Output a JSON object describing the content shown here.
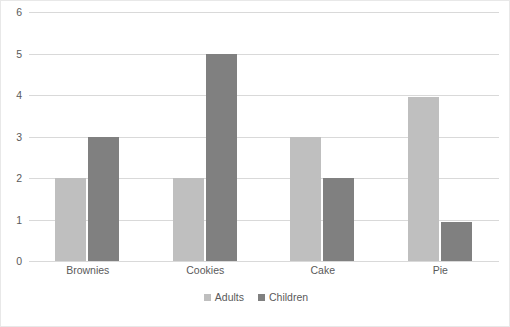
{
  "chart_data": {
    "type": "bar",
    "title": "",
    "subtitle": "",
    "xlabel": "",
    "ylabel": "",
    "categories": [
      "Brownies",
      "Cookies",
      "Cake",
      "Pie"
    ],
    "series": [
      {
        "name": "Adults",
        "color": "#bfbfbf",
        "values": [
          2,
          2,
          3,
          3.95
        ]
      },
      {
        "name": "Children",
        "color": "#808080",
        "values": [
          3,
          5,
          2,
          0.95
        ]
      }
    ],
    "ylim": [
      0,
      6
    ],
    "ytick_labels": [
      "0",
      "1",
      "2",
      "3",
      "4",
      "5",
      "6"
    ],
    "ytick_values": [
      0,
      1,
      2,
      3,
      4,
      5,
      6
    ],
    "grid": true,
    "grid_color": "#d9d9d9",
    "grid_axis": "y",
    "legend_position": "bottom",
    "legend_entries": [
      "Adults",
      "Children"
    ],
    "border_color": "#e8e8e8",
    "text_color": "#5a5a5a",
    "background": "#ffffff"
  }
}
